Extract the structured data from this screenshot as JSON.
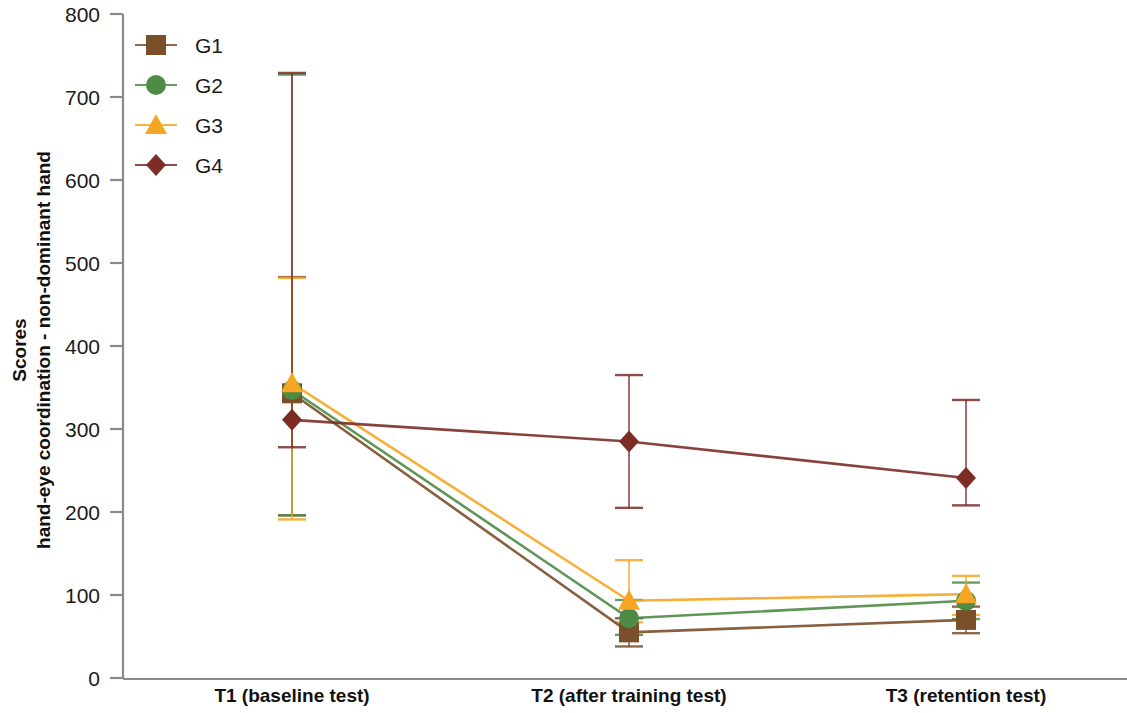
{
  "chart_data": {
    "type": "line",
    "title": "",
    "xlabel": "",
    "ylabel": "Scores\nhand-eye coordination - non-dominant hand",
    "ylabel_line1": "Scores",
    "ylabel_line2": "hand-eye coordination - non-dominant hand",
    "categories": [
      "T1 (baseline test)",
      "T2 (after training test)",
      "T3 (retention test)"
    ],
    "ylim": [
      0,
      800
    ],
    "yticks": [
      0,
      100,
      200,
      300,
      400,
      500,
      600,
      700,
      800
    ],
    "ytick_labels": [
      "0",
      "100",
      "200",
      "300",
      "400",
      "500",
      "600",
      "700",
      "800"
    ],
    "grid": false,
    "legend_position": "top-left",
    "error_bars": true,
    "series": [
      {
        "name": "G1",
        "marker": "square",
        "color": "#7B4F2A",
        "values": [
          343,
          55,
          70
        ],
        "err_low": [
          147,
          17,
          16
        ],
        "err_high": [
          140,
          17,
          16
        ]
      },
      {
        "name": "G2",
        "marker": "circle",
        "color": "#4E8B45",
        "values": [
          347,
          72,
          93
        ],
        "err_low": [
          151,
          20,
          22
        ],
        "err_high": [
          380,
          22,
          22
        ]
      },
      {
        "name": "G3",
        "marker": "triangle",
        "color": "#F5A623",
        "values": [
          355,
          93,
          101
        ],
        "err_low": [
          164,
          26,
          25
        ],
        "err_high": [
          127,
          49,
          22
        ]
      },
      {
        "name": "G4",
        "marker": "diamond",
        "color": "#7B2D26",
        "values": [
          311,
          285,
          241
        ],
        "err_low": [
          33,
          80,
          33
        ],
        "err_high": [
          418,
          80,
          94
        ]
      }
    ]
  },
  "legend": {
    "items": [
      {
        "label": "G1",
        "color": "#7B4F2A",
        "marker": "square"
      },
      {
        "label": "G2",
        "color": "#4E8B45",
        "marker": "circle"
      },
      {
        "label": "G3",
        "color": "#F5A623",
        "marker": "triangle"
      },
      {
        "label": "G4",
        "color": "#7B2D26",
        "marker": "diamond"
      }
    ]
  },
  "axis": {
    "y_title_line1": "Scores",
    "y_title_line2": "hand-eye coordination - non-dominant hand",
    "y_ticks": [
      "800",
      "700",
      "600",
      "500",
      "400",
      "300",
      "200",
      "100",
      "0"
    ],
    "x_ticks": [
      "T1 (baseline test)",
      "T2 (after training test)",
      "T3 (retention test)"
    ]
  }
}
